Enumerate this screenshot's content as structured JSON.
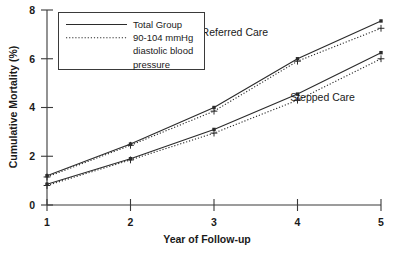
{
  "chart_data": {
    "type": "line",
    "title": "",
    "xlabel": "Year of Follow-up",
    "ylabel": "Cumulative Mortality (%)",
    "x": [
      1,
      2,
      3,
      4,
      5
    ],
    "xticklabels": [
      "1",
      "2",
      "3",
      "4",
      "5"
    ],
    "yticklabels": [
      "0",
      "2",
      "4",
      "6",
      "8"
    ],
    "yticks": [
      0,
      2,
      4,
      6,
      8
    ],
    "xlim": [
      1,
      5
    ],
    "ylim": [
      0,
      8
    ],
    "grid": false,
    "legend_position": "upper-left-inside",
    "series": [
      {
        "name": "Referred Care - Total Group",
        "group": "Referred Care",
        "style": "solid",
        "marker": "square",
        "values": [
          1.2,
          2.5,
          4.0,
          6.0,
          7.55
        ]
      },
      {
        "name": "Referred Care - 90-104 mmHg diastolic blood pressure",
        "group": "Referred Care",
        "style": "dotted",
        "marker": "plus",
        "values": [
          1.15,
          2.45,
          3.85,
          5.9,
          7.25
        ]
      },
      {
        "name": "Stepped Care - Total Group",
        "group": "Stepped Care",
        "style": "solid",
        "marker": "square",
        "values": [
          0.85,
          1.9,
          3.1,
          4.55,
          6.25
        ]
      },
      {
        "name": "Stepped Care - 90-104 mmHg diastolic blood pressure",
        "group": "Stepped Care",
        "style": "dotted",
        "marker": "plus",
        "values": [
          0.8,
          1.85,
          2.95,
          4.3,
          6.0
        ]
      }
    ],
    "annotations": [
      {
        "text": "Referred Care",
        "x": 3.25,
        "y": 6.95
      },
      {
        "text": "Stepped Care",
        "x": 4.3,
        "y": 4.25
      }
    ],
    "legend": {
      "entries": [
        {
          "label": "Total Group",
          "style": "solid"
        },
        {
          "label": "90-104 mmHg",
          "style": "dotted"
        },
        {
          "label": "diastolic blood",
          "style": "none"
        },
        {
          "label": "pressure",
          "style": "none"
        }
      ]
    },
    "colors": {
      "line": "#2b2b2b",
      "axis": "#3a3a3a",
      "text": "#1a1a1a",
      "background": "#ffffff"
    }
  }
}
